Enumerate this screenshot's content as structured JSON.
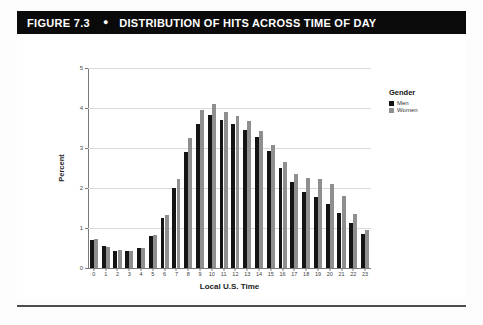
{
  "header": {
    "figure_label": "FIGURE 7.3",
    "bullet": "●",
    "title": "DISTRIBUTION OF HITS ACROSS TIME OF DAY"
  },
  "legend": {
    "title": "Gender",
    "items": [
      {
        "label": "Men",
        "color": "#141414"
      },
      {
        "label": "Women",
        "color": "#8f8f8f"
      }
    ]
  },
  "axes": {
    "y_title": "Percent",
    "x_title": "Local U.S. Time",
    "y_ticks": [
      "0",
      "1",
      "2",
      "3",
      "4",
      "5"
    ]
  },
  "chart_data": {
    "type": "bar",
    "title": "DISTRIBUTION OF HITS ACROSS TIME OF DAY",
    "xlabel": "Local U.S. Time",
    "ylabel": "Percent",
    "ylim": [
      0,
      5
    ],
    "yticks": [
      0,
      1,
      2,
      3,
      4,
      5
    ],
    "grid": true,
    "legend_title": "Gender",
    "legend_position": "top-right",
    "categories": [
      "0",
      "1",
      "2",
      "3",
      "4",
      "5",
      "6",
      "7",
      "8",
      "9",
      "10",
      "11",
      "12",
      "13",
      "14",
      "15",
      "16",
      "17",
      "18",
      "19",
      "20",
      "21",
      "22",
      "23"
    ],
    "series": [
      {
        "name": "Men",
        "color": "#141414",
        "values": [
          0.7,
          0.54,
          0.43,
          0.43,
          0.51,
          0.79,
          1.24,
          2.0,
          2.89,
          3.6,
          3.83,
          3.7,
          3.61,
          3.44,
          3.27,
          2.93,
          2.51,
          2.15,
          1.9,
          1.78,
          1.61,
          1.38,
          1.12,
          0.86
        ]
      },
      {
        "name": "Women",
        "color": "#8f8f8f",
        "values": [
          0.72,
          0.52,
          0.46,
          0.43,
          0.51,
          0.82,
          1.33,
          2.23,
          3.25,
          3.95,
          4.1,
          3.9,
          3.79,
          3.67,
          3.42,
          3.07,
          2.65,
          2.36,
          2.26,
          2.22,
          2.09,
          1.79,
          1.35,
          0.96
        ]
      }
    ]
  }
}
